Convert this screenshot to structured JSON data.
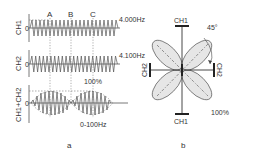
{
  "panel_a": {
    "caption": "a",
    "rows": [
      {
        "channel": "CH1",
        "zero_label": "0",
        "frequency": "4.000Hz"
      },
      {
        "channel": "CH2",
        "zero_label": "0",
        "frequency": "4.100Hz"
      },
      {
        "channel": "CH1+CH2",
        "zero_label": "0",
        "amplitude": "100%",
        "modulation": "0-100Hz"
      }
    ],
    "markers": [
      "A",
      "B",
      "C"
    ]
  },
  "panel_b": {
    "caption": "b",
    "top_label": "CH1",
    "bottom_label": "CH1",
    "left_label": "CH2",
    "right_label": "CH2",
    "angle_label": "45°",
    "amplitude_label": "100%"
  },
  "colors": {
    "line": "#555555",
    "petal_fill": "#e6e6e6",
    "axis": "#333333"
  }
}
